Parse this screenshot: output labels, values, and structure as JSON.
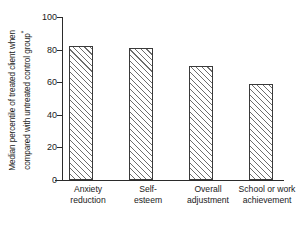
{
  "chart_data": {
    "type": "bar",
    "title": "",
    "subtitle": "",
    "xlabel": "",
    "ylabel": "Median percentile of treated client when compared with untreated control group*",
    "ylabel_lines": [
      "Median percentile of treated client when",
      "compared with untreated control group"
    ],
    "ylabel_footnote_marker": "*",
    "categories": [
      "Anxiety reduction",
      "Self-esteem",
      "Overall adjustment",
      "School or work achievement"
    ],
    "category_lines": [
      [
        "Anxiety",
        "reduction"
      ],
      [
        "Self-",
        "esteem"
      ],
      [
        "Overall",
        "adjustment"
      ],
      [
        "School or work",
        "achievement"
      ]
    ],
    "values": [
      82,
      81,
      70,
      59
    ],
    "ylim": [
      0,
      100
    ],
    "yticks": [
      0,
      20,
      40,
      60,
      80,
      100
    ],
    "ytick_labels": [
      "0",
      "20",
      "40",
      "60",
      "80",
      "100"
    ],
    "grid": false,
    "legend": null,
    "legend_position": "none",
    "bar_fill": "diagonal-hatch",
    "bar_edge_color": "#3a3a3a",
    "axis_color": "#2b2b2b",
    "background_color": "#ffffff"
  }
}
